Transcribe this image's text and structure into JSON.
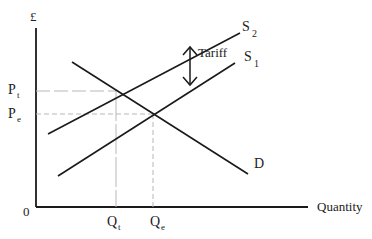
{
  "diagram": {
    "y_axis_label": "£",
    "x_axis_label": "Quantity",
    "origin_label": "0",
    "curves": {
      "demand": {
        "label": "D"
      },
      "supply_original": {
        "label": "S",
        "subscript": "1"
      },
      "supply_tariff": {
        "label": "S",
        "subscript": "2"
      }
    },
    "annotation": {
      "label": "Tariff"
    },
    "price_labels": [
      {
        "label": "P",
        "subscript": "t"
      },
      {
        "label": "P",
        "subscript": "e"
      }
    ],
    "quantity_labels": [
      {
        "label": "Q",
        "subscript": "t"
      },
      {
        "label": "Q",
        "subscript": "e"
      }
    ],
    "colors": {
      "line": "#1a1a1a",
      "guide": "#b8b8b8",
      "background": "#ffffff"
    }
  }
}
